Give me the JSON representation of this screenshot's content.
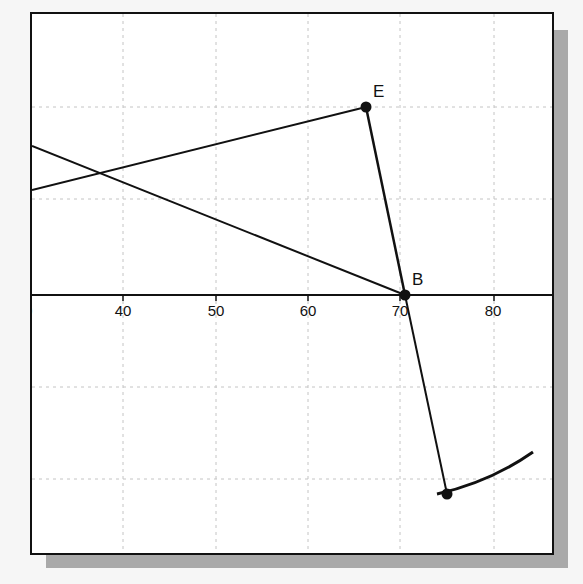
{
  "diagram": {
    "x_axis": {
      "tick_labels": [
        "30",
        "40",
        "50",
        "60",
        "70",
        "80"
      ]
    },
    "points": [
      {
        "label": "E"
      },
      {
        "label": "B"
      },
      {
        "label": ""
      }
    ],
    "colors": {
      "line": "#111111",
      "grid": "#c8c8c8",
      "background": "#ffffff",
      "shadow": "#a9a9a9"
    }
  }
}
